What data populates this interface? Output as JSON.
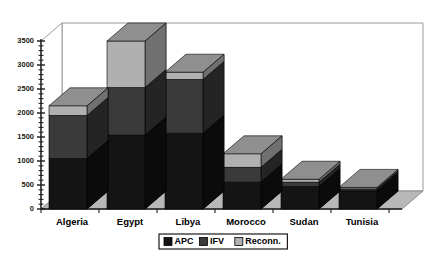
{
  "chart_data": {
    "type": "bar",
    "subtype": "stacked-3d-column",
    "title": "",
    "subtitle": "",
    "xlabel": "",
    "ylabel": "",
    "categories": [
      "Algeria",
      "Egypt",
      "Libya",
      "Morocco",
      "Sudan",
      "Tunisia"
    ],
    "series": [
      {
        "name": "APC",
        "color": "#141414",
        "values": [
          1050,
          1540,
          1580,
          560,
          470,
          380
        ]
      },
      {
        "name": "IFV",
        "color": "#3a3a3a",
        "values": [
          900,
          990,
          1120,
          310,
          90,
          40
        ]
      },
      {
        "name": "Reconn.",
        "color": "#b0b0b0",
        "values": [
          200,
          970,
          150,
          280,
          60,
          30
        ]
      }
    ],
    "totals": [
      2150,
      3500,
      2850,
      1150,
      620,
      450
    ],
    "ylim": [
      0,
      3500
    ],
    "ytick_labels": [
      "0",
      "500",
      "1000",
      "1500",
      "2000",
      "2500",
      "3000",
      "3500"
    ],
    "ytick_values": [
      0,
      500,
      1000,
      1500,
      2000,
      2500,
      3000,
      3500
    ],
    "minor_tick_step": 100,
    "grid": false,
    "legend_position": "bottom",
    "legend_entries": [
      {
        "label": "APC",
        "swatch": "#141414"
      },
      {
        "label": "IFV",
        "swatch": "#3a3a3a"
      },
      {
        "label": "Reconn.",
        "swatch": "#b0b0b0"
      }
    ]
  },
  "colors": {
    "background": "#ffffff",
    "plot_wall": "#ffffff",
    "wall_border": "#9a9a9a",
    "floor": "#b8b8b8",
    "floor_border": "#8c8c8c",
    "axis": "#1a1a1a",
    "apc_front": "#141414",
    "apc_top": "#2e2e2e",
    "apc_side": "#0b0b0b",
    "ifv_front": "#3a3a3a",
    "ifv_top": "#555555",
    "ifv_side": "#242424",
    "reconn_front": "#b0b0b0",
    "reconn_top": "#8f8f8f",
    "reconn_side": "#707070",
    "legend_border": "#1a1a1a",
    "legend_fill": "#ffffff"
  },
  "geometry": {
    "baseline_y": 209,
    "top_value_y": 41,
    "axis_x": 41,
    "depth_dx": 21,
    "depth_dy": -18,
    "plot_right_x": 402,
    "bar_width": 38,
    "slot_width": 58,
    "first_slot_left": 49
  }
}
